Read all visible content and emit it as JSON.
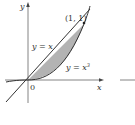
{
  "diagram": {
    "axes": {
      "x_label": "x",
      "y_label": "y",
      "origin_label": "0"
    },
    "curves": [
      {
        "name": "line",
        "equation_label": "y = x"
      },
      {
        "name": "cubic",
        "equation_label_base": "y = x",
        "equation_label_exp": "3"
      }
    ],
    "points": [
      {
        "label": "(1, 1)",
        "x": 1,
        "y": 1
      }
    ],
    "shaded_region": {
      "from_x": 0,
      "to_x": 1,
      "between": [
        "y = x",
        "y = x^3"
      ]
    },
    "colors": {
      "axes": "#555555",
      "curves": "#333333",
      "fill": "#b3b3b3"
    }
  }
}
